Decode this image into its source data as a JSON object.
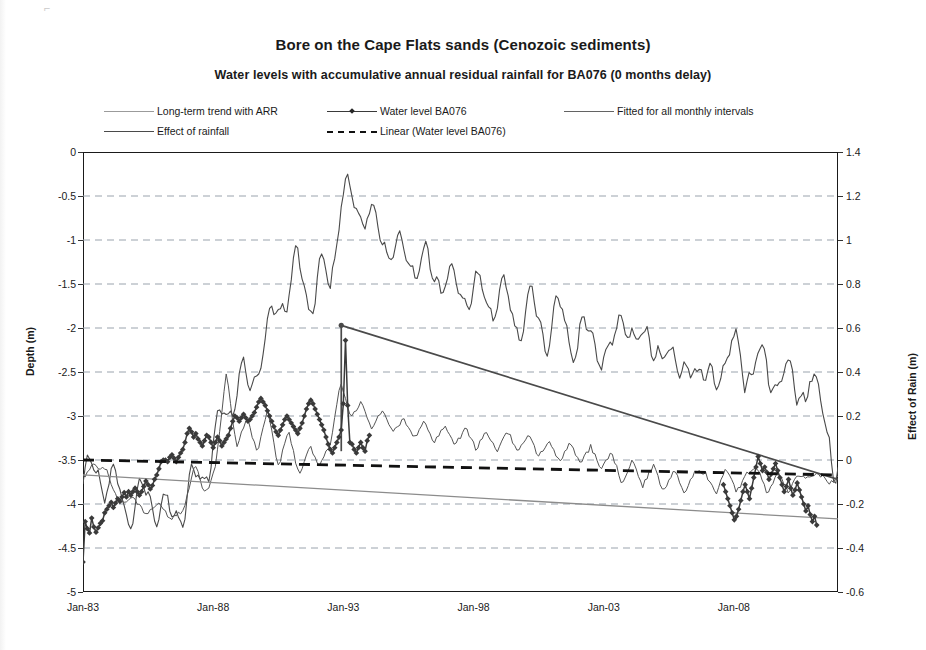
{
  "chart_data": {
    "type": "line",
    "title": "Bore on the Cape Flats sands (Cenozoic sediments)",
    "subtitle": "Water levels with accumulative annual residual rainfall for BA076 (0 months delay)",
    "xlabel": "",
    "ylabel": "Depth (m)",
    "y2label": "Effect of Rain (m)",
    "ylim": [
      -5,
      0
    ],
    "y2lim": [
      -0.6,
      1.4
    ],
    "xlim": [
      "Jan-83",
      "Jan-12"
    ],
    "grid": true,
    "legend_position": "top",
    "y_ticks": [
      "0",
      "-0.5",
      "-1",
      "-1.5",
      "-2",
      "-2.5",
      "-3",
      "-3.5",
      "-4",
      "-4.5",
      "-5"
    ],
    "y_tick_values": [
      0,
      -0.5,
      -1,
      -1.5,
      -2,
      -2.5,
      -3,
      -3.5,
      -4,
      -4.5,
      -5
    ],
    "y2_ticks": [
      "1.4",
      "1.2",
      "1",
      "0.8",
      "0.6",
      "0.4",
      "0.2",
      "0",
      "-0.2",
      "-0.4",
      "-0.6"
    ],
    "y2_tick_values": [
      1.4,
      1.2,
      1.0,
      0.8,
      0.6,
      0.4,
      0.2,
      0,
      -0.2,
      -0.4,
      -0.6
    ],
    "x_ticks": [
      "Jan-83",
      "Jan-88",
      "Jan-93",
      "Jan-98",
      "Jan-03",
      "Jan-08"
    ],
    "x_tick_years": [
      1983,
      1988,
      1993,
      1998,
      2003,
      2008
    ],
    "x_start_year": 1983.0,
    "x_end_year": 2012.0,
    "series": [
      {
        "name": "Long-term trend with ARR",
        "style": "solid-thin",
        "color": "#8c8c8c",
        "axis": "left",
        "kind": "trend",
        "x": [
          1983.0,
          2012.0
        ],
        "values": [
          -3.67,
          -4.17
        ]
      },
      {
        "name": "Water level BA076",
        "style": "solid-marker-diamond",
        "color": "#3a3a3a",
        "axis": "left",
        "kind": "observed",
        "x_start_year": 1983.0,
        "x_step_years": 0.0833,
        "values": [
          -4.66,
          -4.2,
          -4.28,
          -4.33,
          -4.16,
          -4.26,
          -4.32,
          -4.27,
          -4.22,
          -4.19,
          -4.1,
          -4.06,
          -4.02,
          -3.98,
          -4.04,
          -3.99,
          -3.94,
          -3.97,
          -3.92,
          -3.87,
          -3.92,
          -3.86,
          -3.9,
          -3.86,
          -3.82,
          -3.86,
          -3.9,
          -3.86,
          -3.8,
          -3.74,
          -3.78,
          -3.83,
          -3.79,
          -3.72,
          -3.67,
          -3.6,
          -3.52,
          -3.5,
          -3.5,
          -3.52,
          -3.47,
          -3.44,
          -3.48,
          -3.52,
          -3.47,
          -3.42,
          -3.38,
          -3.3,
          -3.2,
          -3.14,
          -3.18,
          -3.24,
          -3.2,
          -3.26,
          -3.3,
          -3.34,
          -3.28,
          -3.22,
          -3.24,
          -3.3,
          -3.36,
          -3.3,
          -3.24,
          -3.28,
          -3.34,
          -3.3,
          -3.26,
          -3.22,
          -3.14,
          -3.06,
          -3.0,
          -3.02,
          -3.06,
          -3.02,
          -2.98,
          -3.02,
          -3.06,
          -3.04,
          -3.0,
          -2.96,
          -2.9,
          -2.84,
          -2.8,
          -2.84,
          -2.88,
          -2.94,
          -3.0,
          -3.06,
          -3.12,
          -3.18,
          -3.22,
          -3.16,
          -3.1,
          -3.04,
          -3.0,
          -3.04,
          -3.08,
          -3.12,
          -3.16,
          -3.2,
          -3.14,
          -3.08,
          -3.0,
          -2.92,
          -2.86,
          -2.82,
          -2.86,
          -2.92,
          -2.98,
          -3.04,
          -3.1,
          -3.16,
          -3.24,
          -3.32,
          -3.38,
          -3.42,
          -3.36,
          -3.3,
          -3.24,
          -3.16,
          -2.86,
          -2.14,
          -2.88,
          -3.3,
          -3.32,
          -3.38,
          -3.42,
          -3.36,
          -3.3,
          -3.36,
          -3.4,
          -3.28,
          -3.22
        ]
      },
      {
        "name": "Fitted for all monthly intervals",
        "style": "solid-thin",
        "color": "#555555",
        "axis": "left",
        "kind": "fitted",
        "note": "Fluctuating fitted curve shown over full record, lower amplitude band roughly -4.3 to -2.5 pre-1993, then -3.9 to -2.8 and declining after 2003"
      },
      {
        "name": "Effect of rainfall",
        "style": "solid",
        "color": "#4a4a4a",
        "axis": "right",
        "kind": "rainfall",
        "note": "Strongly oscillating accumulative annual residual rainfall curve, peaking at about 1.23 in Jan-93 and declining to about -0.04 by 2012; also shows linear descent segment from 0.60 at Jan-93 to about -0.07 at 2012"
      },
      {
        "name": "Linear (Water level BA076)",
        "style": "dashed-thick",
        "color": "#111111",
        "axis": "left",
        "kind": "linear-regression",
        "x": [
          1983.0,
          2012.0
        ],
        "values": [
          -3.5,
          -3.67
        ]
      }
    ],
    "annotations": [
      {
        "text": "spike in water level record",
        "x_year": 1992.6,
        "value": -2.14
      }
    ]
  },
  "legend": {
    "items": [
      {
        "label": "Long-term trend with ARR",
        "marker": "line-thin-gray"
      },
      {
        "label": "Water level BA076",
        "marker": "line-with-diamond"
      },
      {
        "label": "Fitted for all monthly intervals",
        "marker": "line-thin-gray"
      },
      {
        "label": "Effect of rainfall",
        "marker": "line-solid-dark"
      },
      {
        "label": "Linear (Water level BA076)",
        "marker": "line-dashed-thick"
      }
    ]
  },
  "colors": {
    "trend": "#8c8c8c",
    "observed": "#3a3a3a",
    "fitted": "#555555",
    "rainfall": "#4a4a4a",
    "linear": "#111111",
    "grid": "#9aa3ad",
    "frame": "#1a1a1a"
  }
}
